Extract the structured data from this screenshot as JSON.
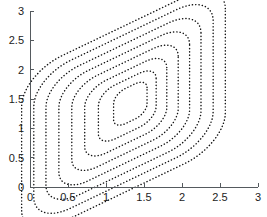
{
  "figure": {
    "title": "",
    "background_color": "#ffffff",
    "width": 267,
    "height": 217
  },
  "axes": {
    "line_color": "#555a5e",
    "tick_label_color": "#1c1c1c",
    "x": {
      "label": "",
      "min": 0,
      "max": 3,
      "tick_values": [
        0,
        0.5,
        1,
        1.5,
        2,
        2.5,
        3
      ],
      "tick_labels": [
        "0",
        "0.5",
        "1",
        "1.5",
        "2",
        "2.5",
        "3"
      ]
    },
    "y": {
      "label": "",
      "min": 0,
      "max": 3,
      "tick_values": [
        0,
        0.5,
        1,
        1.5,
        2,
        2.5,
        3
      ],
      "tick_labels": [
        "0",
        "0.5",
        "1",
        "1.5",
        "2",
        "2.5",
        "3"
      ]
    }
  },
  "chart_data": {
    "type": "line",
    "subtype": "contour",
    "title": "",
    "xlabel": "",
    "ylabel": "",
    "xlim": [
      0,
      3
    ],
    "ylim": [
      0,
      3
    ],
    "grid": false,
    "legend": "none",
    "line_style": "dotted",
    "line_color": "#141414",
    "contours": [
      {
        "level": 1,
        "name": "contour-1-innermost",
        "center": [
          1.32,
          1.42
        ],
        "half_width": 0.22,
        "half_height": 0.3,
        "corner_radius": 0.16,
        "shear": 0.62
      },
      {
        "level": 2,
        "name": "contour-2",
        "center": [
          1.28,
          1.38
        ],
        "half_width": 0.38,
        "half_height": 0.46,
        "corner_radius": 0.22,
        "shear": 0.62
      },
      {
        "level": 3,
        "name": "contour-3",
        "center": [
          1.26,
          1.36
        ],
        "half_width": 0.54,
        "half_height": 0.62,
        "corner_radius": 0.28,
        "shear": 0.62
      },
      {
        "level": 4,
        "name": "contour-4",
        "center": [
          1.25,
          1.35
        ],
        "half_width": 0.7,
        "half_height": 0.78,
        "corner_radius": 0.33,
        "shear": 0.62
      },
      {
        "level": 5,
        "name": "contour-5",
        "center": [
          1.24,
          1.34
        ],
        "half_width": 0.86,
        "half_height": 0.94,
        "corner_radius": 0.38,
        "shear": 0.62
      },
      {
        "level": 6,
        "name": "contour-6",
        "center": [
          1.23,
          1.33
        ],
        "half_width": 1.02,
        "half_height": 1.1,
        "corner_radius": 0.43,
        "shear": 0.62
      },
      {
        "level": 7,
        "name": "contour-7",
        "center": [
          1.23,
          1.33
        ],
        "half_width": 1.18,
        "half_height": 1.26,
        "corner_radius": 0.48,
        "shear": 0.62
      },
      {
        "level": 8,
        "name": "contour-8-outermost",
        "center": [
          1.23,
          1.32
        ],
        "half_width": 1.34,
        "half_height": 1.42,
        "corner_radius": 0.53,
        "shear": 0.62
      }
    ]
  }
}
